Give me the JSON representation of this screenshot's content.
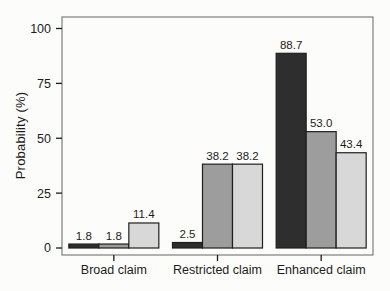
{
  "chart_data": {
    "type": "bar",
    "title": "",
    "xlabel": "",
    "ylabel": "Probability (%)",
    "categories": [
      "Broad claim",
      "Restricted claim",
      "Enhanced claim"
    ],
    "series": [
      {
        "name": "dark-bar",
        "color": "#2e2e2e",
        "values": [
          1.8,
          2.5,
          88.7
        ]
      },
      {
        "name": "medium-bar",
        "color": "#9d9d9d",
        "values": [
          1.8,
          38.2,
          53.0
        ]
      },
      {
        "name": "light-bar",
        "color": "#d8d8d8",
        "values": [
          11.4,
          38.2,
          43.4
        ]
      }
    ],
    "bar_value_labels": [
      [
        "1.8",
        "2.5",
        "88.7"
      ],
      [
        "1.8",
        "38.2",
        "53.0"
      ],
      [
        "11.4",
        "38.2",
        "43.4"
      ]
    ],
    "yticks": [
      "0",
      "25",
      "50",
      "75",
      "100"
    ],
    "ylim": [
      0,
      100
    ],
    "grid": false,
    "legend_position": "none",
    "colors": {
      "bar_stroke": "#1e1e1e",
      "panel_border": "#7d7d7d",
      "tick": "#1c1c1c",
      "text": "#1c1c1c",
      "background": "#fcfcfa"
    }
  }
}
